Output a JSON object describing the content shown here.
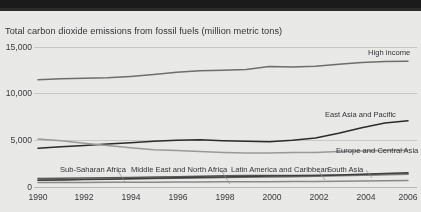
{
  "chart_data": {
    "type": "line",
    "title": "Total carbon dioxide emissions from fossil fuels (million metric tons)",
    "xlabel": "",
    "ylabel": "",
    "ylim": [
      0,
      15000
    ],
    "xlim": [
      1990,
      2006
    ],
    "grid": true,
    "legend_position": "inline-end-of-line",
    "ytick_labels": [
      "15,000",
      "10,000",
      "5,000",
      "0"
    ],
    "ytick_values": [
      15000,
      10000,
      5000,
      0
    ],
    "xtick_labels": [
      "1990",
      "1992",
      "1994",
      "1996",
      "1998",
      "2000",
      "2002",
      "2004",
      "2006"
    ],
    "x": [
      1990,
      1991,
      1992,
      1993,
      1994,
      1995,
      1996,
      1997,
      1998,
      1999,
      2000,
      2001,
      2002,
      2003,
      2004,
      2005,
      2006
    ],
    "series": [
      {
        "name": "High income",
        "color": "#6e6e6e",
        "values": [
          11500,
          11600,
          11650,
          11700,
          11850,
          12050,
          12300,
          12450,
          12500,
          12600,
          12900,
          12850,
          12950,
          13150,
          13350,
          13450,
          13480
        ]
      },
      {
        "name": "East Asia and Pacific",
        "color": "#2b2b2b",
        "values": [
          4150,
          4300,
          4450,
          4600,
          4750,
          4900,
          5000,
          5050,
          4950,
          4900,
          4850,
          5000,
          5250,
          5750,
          6350,
          6850,
          7100
        ]
      },
      {
        "name": "Europe and Central Asia",
        "color": "#9a9a9a",
        "values": [
          5150,
          4950,
          4700,
          4450,
          4200,
          4000,
          3900,
          3800,
          3700,
          3650,
          3650,
          3700,
          3700,
          3800,
          3850,
          3900,
          3950
        ]
      },
      {
        "name": "Latin America and Caribbean",
        "color": "#5a5a5a",
        "values": [
          900,
          930,
          960,
          990,
          1030,
          1070,
          1110,
          1160,
          1200,
          1220,
          1240,
          1230,
          1230,
          1250,
          1310,
          1360,
          1400
        ]
      },
      {
        "name": "Middle East and North Africa",
        "color": "#7c7c7c",
        "values": [
          760,
          790,
          820,
          850,
          880,
          910,
          940,
          975,
          1010,
          1040,
          1070,
          1110,
          1150,
          1200,
          1260,
          1320,
          1370
        ]
      },
      {
        "name": "South Asia",
        "color": "#3f3f3f",
        "values": [
          720,
          760,
          800,
          840,
          890,
          940,
          990,
          1040,
          1080,
          1130,
          1170,
          1200,
          1240,
          1290,
          1370,
          1450,
          1530
        ]
      },
      {
        "name": "Sub-Saharan Africa",
        "color": "#8a8a8a",
        "values": [
          480,
          490,
          495,
          500,
          510,
          520,
          530,
          545,
          555,
          560,
          570,
          580,
          590,
          620,
          650,
          680,
          700
        ]
      }
    ]
  },
  "chart": {
    "title": "Total carbon dioxide emissions from fossil fuels (million metric tons)",
    "yticks": [
      {
        "label": "15,000"
      },
      {
        "label": "10,000"
      },
      {
        "label": "5,000"
      },
      {
        "label": "0"
      }
    ],
    "xticks": [
      {
        "label": "1990"
      },
      {
        "label": "1992"
      },
      {
        "label": "1994"
      },
      {
        "label": "1996"
      },
      {
        "label": "1998"
      },
      {
        "label": "2000"
      },
      {
        "label": "2002"
      },
      {
        "label": "2004"
      },
      {
        "label": "2006"
      }
    ],
    "labels": {
      "high_income": "High income",
      "east_asia_pacific": "East Asia and Pacific",
      "europe_central_asia": "Europe and Central Asia",
      "sub_saharan_africa": "Sub-Saharan Africa",
      "middle_east_north_africa": "Middle East and North Africa",
      "latin_america_caribbean": "Latin America and Caribbean",
      "south_asia": "South Asia"
    }
  }
}
